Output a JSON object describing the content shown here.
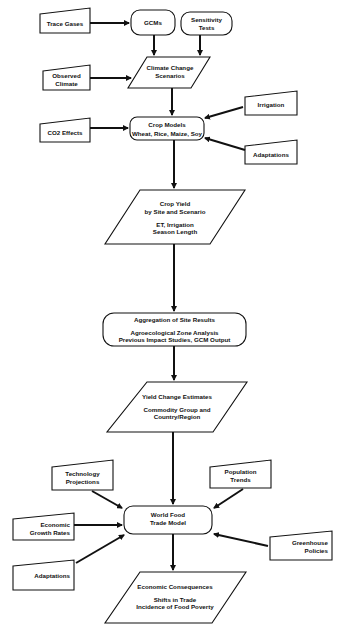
{
  "diagram": {
    "inputs": {
      "trace_gases": "Trace Gases",
      "observed_climate": [
        "Observed",
        "Climate"
      ],
      "co2_effects": "CO2 Effects",
      "irrigation": "Irrigation",
      "adaptations_crop": "Adaptations",
      "technology_projections": [
        "Technology",
        "Projections"
      ],
      "population_trends": [
        "Population",
        "Trends"
      ],
      "economic_growth_rates": [
        "Economic",
        "Growth Rates"
      ],
      "greenhouse_policies": [
        "Greenhouse",
        "Policies"
      ],
      "adaptations_trade": "Adaptations"
    },
    "processes": {
      "gcms": "GCMs",
      "sensitivity_tests": [
        "Sensitivity",
        "Tests"
      ],
      "crop_models": {
        "title": "Crop Models",
        "detail": "Wheat, Rice, Maize, Soy"
      },
      "aggregation": {
        "title": "Aggregation of Site Results",
        "detail": [
          "Agroecological Zone Analysis",
          "Previous Impact Studies, GCM Output"
        ]
      },
      "world_food_trade_model": [
        "World Food",
        "Trade Model"
      ]
    },
    "outputs": {
      "climate_change_scenarios": [
        "Climate Change",
        "Scenarios"
      ],
      "crop_yield": {
        "title": [
          "Crop Yield",
          "by Site and Scenario"
        ],
        "detail": [
          "ET, Irrigation",
          "Season Length"
        ]
      },
      "yield_change_estimates": {
        "title": "Yield Change Estimates",
        "detail": [
          "Commodity Group and",
          "Country/Region"
        ]
      },
      "economic_consequences": {
        "title": "Economic Consequences",
        "detail": [
          "Shifts in Trade",
          "Incidence of Food Poverty"
        ]
      }
    },
    "colors": {
      "stroke": "#111111",
      "fill": "#ffffff"
    }
  }
}
